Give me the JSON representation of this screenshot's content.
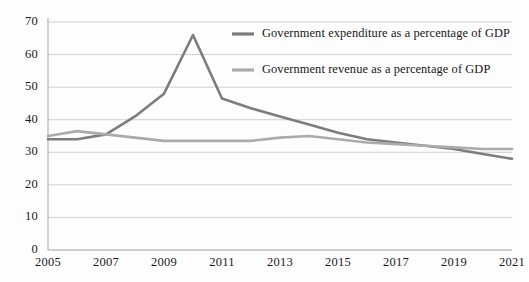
{
  "chart_data": {
    "type": "line",
    "title": "",
    "xlabel": "",
    "ylabel": "",
    "xlim": [
      2005,
      2021
    ],
    "ylim": [
      0,
      70
    ],
    "ytick_step": 10,
    "xtick_step": 2,
    "grid": true,
    "legend_position": "top-right-inside",
    "yticks": [
      "0",
      "10",
      "20",
      "30",
      "40",
      "50",
      "60",
      "70"
    ],
    "xticks": [
      "2005",
      "2007",
      "2009",
      "2011",
      "2013",
      "2015",
      "2017",
      "2019",
      "2021"
    ],
    "x": [
      2005,
      2006,
      2007,
      2008,
      2009,
      2010,
      2011,
      2012,
      2013,
      2014,
      2015,
      2016,
      2017,
      2018,
      2019,
      2020,
      2021
    ],
    "series": [
      {
        "name": "Government expenditure as a percentage of GDP",
        "color": "#7d7d7d",
        "values": [
          34.0,
          34.0,
          35.5,
          41.0,
          48.0,
          66.0,
          46.5,
          43.5,
          41.0,
          38.5,
          36.0,
          34.0,
          33.0,
          32.0,
          31.0,
          29.5,
          28.0
        ]
      },
      {
        "name": "Government revenue as a percentage of GDP",
        "color": "#ababab",
        "values": [
          35.0,
          36.5,
          35.5,
          34.5,
          33.5,
          33.5,
          33.5,
          33.5,
          34.5,
          35.0,
          34.0,
          33.0,
          32.5,
          32.0,
          31.5,
          31.0,
          31.0
        ]
      }
    ]
  },
  "legend": {
    "entries": [
      {
        "label": "Government expenditure as a percentage of GDP",
        "swatch_color": "#7d7d7d"
      },
      {
        "label": "Government revenue as a percentage of GDP",
        "swatch_color": "#ababab"
      }
    ]
  },
  "axes": {
    "y_axis_name": "percentage-of-gdp-axis",
    "x_axis_name": "year-axis"
  },
  "colors": {
    "grid": "#cfcfcf",
    "axis": "#b5b5b5",
    "text": "#161616",
    "background": "#fdfdfd"
  }
}
